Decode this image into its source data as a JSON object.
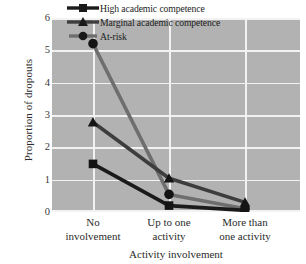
{
  "chart_data": {
    "type": "line",
    "title": "",
    "xlabel": "Activity involvement",
    "ylabel": "Proportion of dropouts",
    "categories": [
      "No involvement",
      "Up to one activity",
      "More than one activity"
    ],
    "category_lines": [
      [
        "No",
        "involvement"
      ],
      [
        "Up to one",
        "activity"
      ],
      [
        "More than",
        "one activity"
      ]
    ],
    "ylim": [
      0,
      6
    ],
    "yticks": [
      0,
      1,
      2,
      3,
      4,
      5,
      6
    ],
    "ytick_labels": [
      "0",
      "1",
      "2",
      "3",
      "4",
      "5",
      "6"
    ],
    "grid": true,
    "grid_color": "#f2f2f2",
    "plot_background": "#b2b2b2",
    "legend_position": "top-right-inside",
    "series": [
      {
        "name": "High academic competence",
        "marker": "square",
        "color": "#1a1a1a",
        "values": [
          1.5,
          0.2,
          0.05
        ]
      },
      {
        "name": "Marginal academic competence",
        "marker": "triangle",
        "color": "#3d3d3d",
        "values": [
          2.8,
          1.05,
          0.3
        ]
      },
      {
        "name": "At-risk",
        "marker": "circle",
        "color": "#6e6e6e",
        "values": [
          5.25,
          0.55,
          0.1
        ]
      }
    ]
  }
}
